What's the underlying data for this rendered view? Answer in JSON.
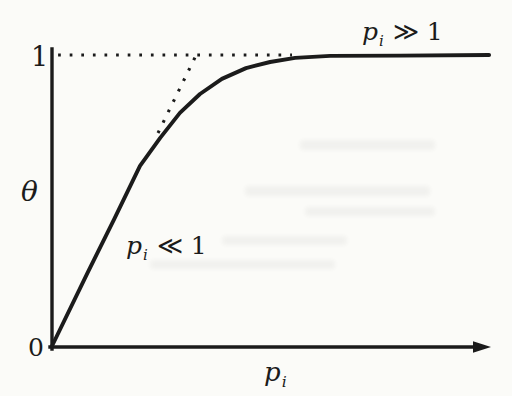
{
  "figure": {
    "background_color": "#fbfbf8",
    "ink_color": "#1b1b1b",
    "description_visible_elements": "hand-drawn saturating curve with dotted asymptote and dotted initial-slope tangent"
  },
  "chart_data": {
    "type": "line",
    "title": "",
    "xlabel": "pᵢ",
    "xlabel_parts": {
      "base": "p",
      "sub": "i"
    },
    "ylabel": "θ",
    "origin_label": "0",
    "xlim": [
      0,
      1
    ],
    "ylim": [
      0,
      1
    ],
    "grid": false,
    "legend": "none",
    "y_ticks": [
      {
        "value": 1,
        "label": "1"
      },
      {
        "value": 0,
        "label": "0"
      }
    ],
    "x_ticks": [],
    "series": [
      {
        "id": "isotherm",
        "name": "adsorption isotherm θ(pᵢ)",
        "style": "solid",
        "x": [
          0,
          0.082,
          0.142,
          0.201,
          0.247,
          0.292,
          0.338,
          0.388,
          0.443,
          0.498,
          0.555,
          0.635,
          0.795,
          0.998
        ],
        "y": [
          0,
          0.254,
          0.436,
          0.619,
          0.715,
          0.801,
          0.866,
          0.918,
          0.955,
          0.976,
          0.99,
          0.997,
          0.998,
          1.0
        ]
      },
      {
        "id": "saturation-limit",
        "name": "saturation level θ = 1",
        "style": "dotted",
        "x": [
          0.014,
          0.548
        ],
        "y": [
          1,
          1
        ]
      },
      {
        "id": "initial-slope-tangent",
        "name": "low-pressure linear tangent",
        "style": "dotted",
        "x": [
          0.242,
          0.327
        ],
        "y": [
          0.732,
          0.993
        ]
      }
    ],
    "annotations": [
      {
        "text": "pᵢ ≫ 1",
        "parts": {
          "base": "p",
          "sub": "i",
          "rest": "≫ 1"
        },
        "x": 0.8,
        "y": 1.083
      },
      {
        "text": "pᵢ ≪ 1",
        "parts": {
          "base": "p",
          "sub": "i",
          "rest": "≪ 1"
        },
        "x": 0.261,
        "y": 0.347
      }
    ]
  }
}
